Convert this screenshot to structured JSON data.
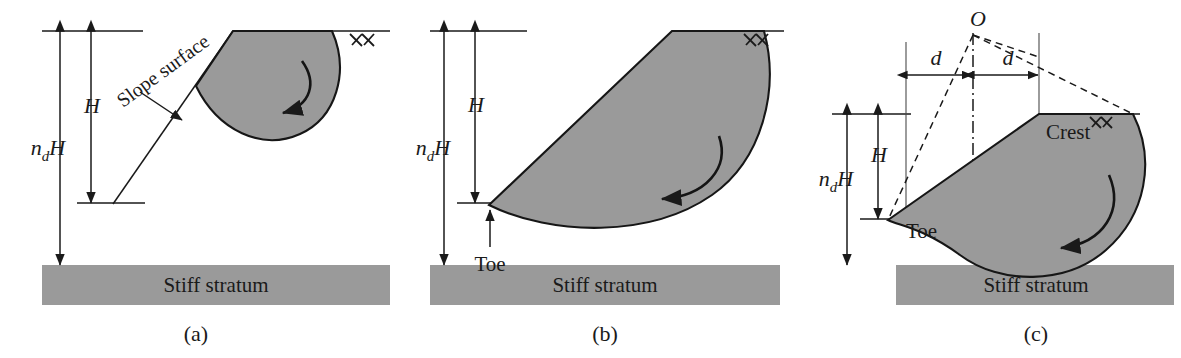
{
  "figure": {
    "background_color": "#ffffff",
    "soil_fill_color": "#9a9a9a",
    "line_color": "#1a1a1a"
  },
  "panels": [
    {
      "id": "a",
      "caption": "(a)",
      "failure_mode": "slope failure",
      "labels": {
        "slope_surface": "Slope surface",
        "height": "H",
        "depth_n": "n",
        "depth_sub": "d",
        "depth_h": "H",
        "stratum": "Stiff stratum"
      }
    },
    {
      "id": "b",
      "caption": "(b)",
      "failure_mode": "toe failure",
      "labels": {
        "toe": "Toe",
        "height": "H",
        "depth_n": "n",
        "depth_sub": "d",
        "depth_h": "H",
        "stratum": "Stiff stratum"
      }
    },
    {
      "id": "c",
      "caption": "(c)",
      "failure_mode": "base failure",
      "labels": {
        "center": "O",
        "dist_left": "d",
        "dist_right": "d",
        "crest": "Crest",
        "toe": "Toe",
        "height": "H",
        "depth_n": "n",
        "depth_sub": "d",
        "depth_h": "H",
        "stratum": "Stiff stratum"
      }
    }
  ]
}
